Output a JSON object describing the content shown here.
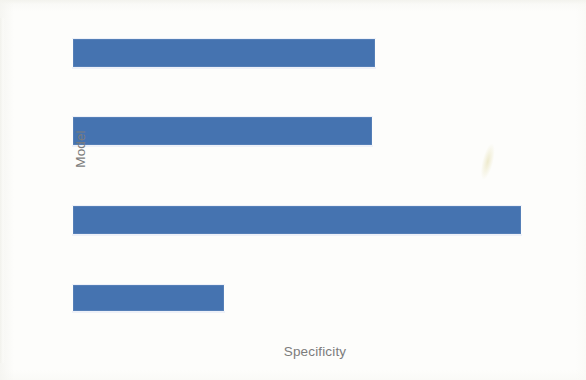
{
  "chart_data": {
    "type": "bar",
    "orientation": "horizontal",
    "title": "",
    "subtitle": "",
    "xlabel": "Specificity",
    "ylabel": "Model",
    "categories": [
      "",
      "",
      "",
      ""
    ],
    "tick_labels_x": [],
    "tick_labels_y": [],
    "values": [
      0.67,
      0.66,
      1.0,
      0.34
    ],
    "bar_pixel_lengths": [
      302,
      299,
      448,
      151
    ],
    "xlim": [
      0,
      1.0
    ],
    "grid": false,
    "legend": null,
    "legend_position": "none",
    "axis_lines": false,
    "annotations": [],
    "series": [
      {
        "name": "Specificity",
        "color": "#4573b0",
        "values": [
          0.67,
          0.66,
          1.0,
          0.34
        ]
      }
    ],
    "bars": [
      {
        "index": 1,
        "value": 0.67,
        "x": 73,
        "y": 39,
        "width": 302,
        "height": 28
      },
      {
        "index": 2,
        "value": 0.66,
        "x": 73,
        "y": 117,
        "width": 299,
        "height": 28
      },
      {
        "index": 3,
        "value": 1.0,
        "x": 73,
        "y": 206,
        "width": 448,
        "height": 28
      },
      {
        "index": 4,
        "value": 0.34,
        "x": 73,
        "y": 285,
        "width": 151,
        "height": 26
      }
    ]
  },
  "colors": {
    "bar": "#4573b0",
    "axis_label_text": "#7c7c7c",
    "background": "#fdfdfb"
  }
}
